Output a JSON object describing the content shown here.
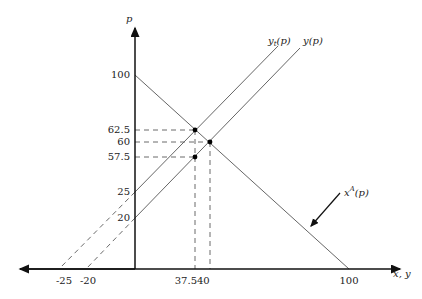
{
  "diagram": {
    "axes": {
      "y_label": "p",
      "x_label": "x, y"
    },
    "y_ticks": [
      "100",
      "62.5",
      "60",
      "57.5",
      "25",
      "20"
    ],
    "x_ticks": [
      "-25",
      "-20",
      "37.5",
      "40",
      "100"
    ],
    "curves": {
      "demand": {
        "base": "x",
        "sup": "A",
        "arg": "(p)"
      },
      "supply_t": {
        "base": "y",
        "sub": "t",
        "arg": "(p)"
      },
      "supply": {
        "base": "y",
        "arg": "(p)"
      }
    },
    "points": [
      {
        "x": 37.5,
        "p": 62.5
      },
      {
        "x": 40,
        "p": 60
      },
      {
        "x": 37.5,
        "p": 57.5
      }
    ]
  }
}
